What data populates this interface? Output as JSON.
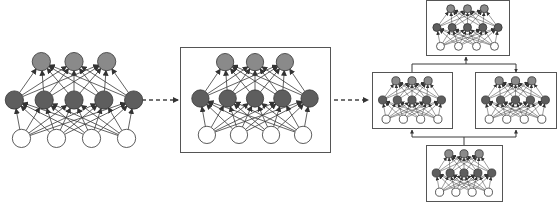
{
  "diagram": {
    "colors": {
      "output_node": "#8a8a8a",
      "hidden_node": "#5e5e5e",
      "input_node": "#ffffff",
      "node_stroke": "#333333",
      "edge": "#3a3a3a",
      "box_stroke": "#555555",
      "dashed_arrow": "#444444",
      "background": "#ffffff"
    },
    "network_template": {
      "layers": [
        {
          "name": "output",
          "count": 3
        },
        {
          "name": "hidden",
          "count": 5
        },
        {
          "name": "input",
          "count": 4
        }
      ]
    },
    "stages": [
      {
        "id": "single-network",
        "boxed": false,
        "x": 0,
        "y": 52,
        "w": 142,
        "h": 96
      },
      {
        "id": "boxed-network",
        "boxed": true,
        "x": 180,
        "y": 47,
        "w": 150,
        "h": 105
      },
      {
        "id": "ensemble",
        "networks": [
          {
            "id": "top",
            "x": 426,
            "y": 0,
            "w": 83,
            "h": 55
          },
          {
            "id": "left",
            "x": 372,
            "y": 72,
            "w": 80,
            "h": 56
          },
          {
            "id": "right",
            "x": 475,
            "y": 72,
            "w": 81,
            "h": 56
          },
          {
            "id": "bottom",
            "x": 426,
            "y": 145,
            "w": 76,
            "h": 56
          }
        ]
      }
    ],
    "arrows": [
      {
        "id": "arrow-1",
        "style": "dashed",
        "from": [
          142,
          100
        ],
        "to": [
          178,
          100
        ]
      },
      {
        "id": "arrow-2",
        "style": "dashed",
        "from": [
          334,
          100
        ],
        "to": [
          368,
          100
        ]
      }
    ],
    "connectors": [
      {
        "id": "bottom-to-left",
        "path": [
          [
            464,
            145
          ],
          [
            464,
            137
          ],
          [
            412,
            137
          ],
          [
            412,
            130
          ]
        ]
      },
      {
        "id": "bottom-to-right",
        "path": [
          [
            464,
            137
          ],
          [
            516,
            137
          ],
          [
            516,
            130
          ]
        ]
      },
      {
        "id": "left-to-top",
        "path": [
          [
            412,
            72
          ],
          [
            412,
            64
          ],
          [
            516,
            64
          ],
          [
            516,
            72
          ]
        ]
      },
      {
        "id": "mid-to-top",
        "path": [
          [
            466,
            64
          ],
          [
            466,
            57
          ]
        ]
      }
    ]
  }
}
